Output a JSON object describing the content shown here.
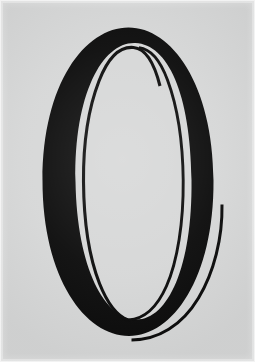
{
  "image": {
    "kind": "photograph-of-letterform",
    "subject_label": "O",
    "description": "Ornamental high-contrast capital letter O",
    "width_px": 255,
    "height_px": 362,
    "background_color": "#d6d7d7",
    "ink_color": "#0b0b0b",
    "edge_frame_color": "#e4e5e5",
    "alt_text": "Large black ornamental capital letter O on a light gray background"
  },
  "glyph": {
    "character": "O",
    "style_name": "didone-high-contrast",
    "stroke_color": "#0b0b0b",
    "counter_color": "#d6d7d7",
    "parts": [
      {
        "name": "thick-bowl",
        "role": "primary-stroke",
        "description": "Thick black oval bowl with thin top and bottom, heavy left and right shoulders"
      },
      {
        "name": "inner-hairline",
        "role": "secondary-stroke",
        "description": "Thin inner hairline following the counter, open at upper right and lower right"
      },
      {
        "name": "outer-hairline-flourish",
        "role": "flourish-stroke",
        "description": "Thin outer hairline sweeping from mid right down around the bottom, terminating at lower center"
      }
    ],
    "bounds": {
      "left_px": 42,
      "right_px": 222,
      "top_px": 27,
      "bottom_px": 341
    },
    "terminals": [
      {
        "name": "inner-hairline-top-terminal",
        "x_px": 160,
        "y_px": 86
      },
      {
        "name": "inner-hairline-bottom-terminal",
        "x_px": 128,
        "y_px": 320
      },
      {
        "name": "outer-hairline-top-terminal",
        "x_px": 222,
        "y_px": 204
      },
      {
        "name": "outer-hairline-bottom-terminal",
        "x_px": 131,
        "y_px": 340
      }
    ]
  }
}
